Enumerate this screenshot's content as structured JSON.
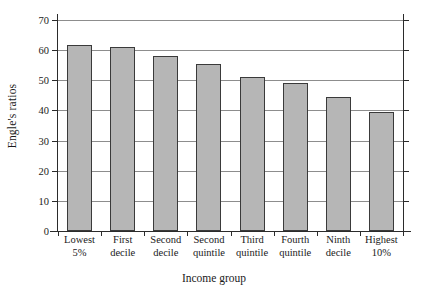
{
  "chart_data": {
    "type": "bar",
    "title": "",
    "xlabel": "Income group",
    "ylabel": "Engle's ratios",
    "categories": [
      "Lowest\n5%",
      "First\ndecile",
      "Second\ndecile",
      "Second\nquintile",
      "Third\nquintile",
      "Fourth\nquintile",
      "Ninth\ndecile",
      "Highest\n10%"
    ],
    "category_lines": [
      [
        "Lowest",
        "5%"
      ],
      [
        "First",
        "decile"
      ],
      [
        "Second",
        "decile"
      ],
      [
        "Second",
        "quintile"
      ],
      [
        "Third",
        "quintile"
      ],
      [
        "Fourth",
        "quintile"
      ],
      [
        "Ninth",
        "decile"
      ],
      [
        "Highest",
        "10%"
      ]
    ],
    "values": [
      61.8,
      61.2,
      58.0,
      55.3,
      51.0,
      49.0,
      44.5,
      39.5
    ],
    "ylim": [
      0,
      70
    ],
    "yticks": [
      0,
      10,
      20,
      30,
      40,
      50,
      60,
      70
    ],
    "ytick_labels": [
      "0",
      "10",
      "20",
      "30",
      "40",
      "50",
      "60",
      "70"
    ],
    "grid": true,
    "grid_axis": "y",
    "legend": null,
    "bar_fill_color": "#b6b6b6",
    "bar_edge_color": "#3a3a3a",
    "grid_color": "#8d8d8d",
    "axis_color": "#2b2b2b",
    "background_color": "#ffffff"
  }
}
